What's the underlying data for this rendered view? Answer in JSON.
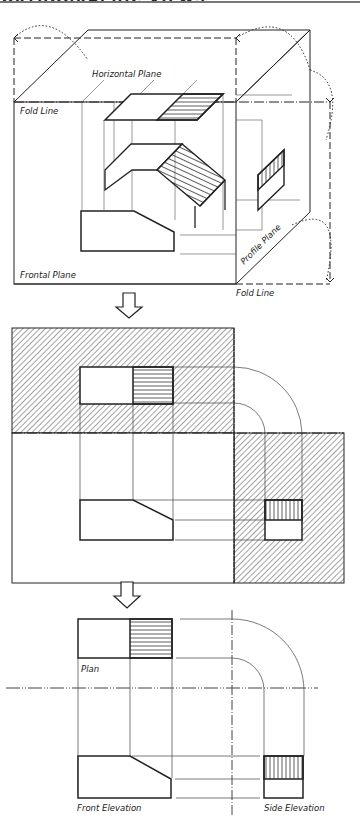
{
  "title": "ORTHOGRAPHIC VIEWS",
  "pictorial": {
    "labels": {
      "horizontal_plane": "Horizontal Plane",
      "fold_line_left": "Fold Line",
      "frontal_plane": "Frontal Plane",
      "profile_plane": "Profile Plane",
      "fold_line_bottom": "Fold Line"
    }
  },
  "arrows": [
    {
      "name": "arrow-down-1",
      "glyph": "⇩"
    },
    {
      "name": "arrow-down-2",
      "glyph": "⇩"
    }
  ],
  "final_views": {
    "labels": {
      "plan": "Plan",
      "front_elevation": "Front Elevation",
      "side_elevation": "Side Elevation"
    }
  },
  "colors": {
    "line": "#222222",
    "hatch": "#555555",
    "background": "#ffffff"
  }
}
